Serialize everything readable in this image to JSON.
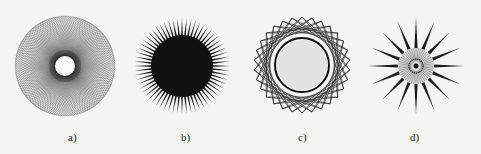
{
  "figures": [
    {
      "id": "a",
      "label": "a)",
      "description": "dense spirograph rosette with white center hole",
      "cx": 65,
      "cy": 66,
      "r_outer": 50,
      "r_inner": 10,
      "petals": 72
    },
    {
      "id": "b",
      "label": "b)",
      "description": "starburst with solid dark core and thin radial spikes",
      "cx": 182,
      "cy": 66,
      "r_outer": 48,
      "r_inner": 28,
      "spikes": 64
    },
    {
      "id": "c",
      "label": "c)",
      "description": "star polygon rosette with light gray center circle",
      "cx": 302,
      "cy": 65,
      "r_outer": 48,
      "r_inner": 25,
      "points": 30
    },
    {
      "id": "d",
      "label": "d)",
      "description": "sun-like figure with long dark spikes and textured center",
      "cx": 416,
      "cy": 66,
      "r_outer": 48,
      "r_inner": 15,
      "spikes": 16
    }
  ],
  "colors": {
    "background": "#f4f4f2",
    "ink": "#1a1a1a",
    "gray": "#555555",
    "center_fill": "#e2e2e0"
  }
}
